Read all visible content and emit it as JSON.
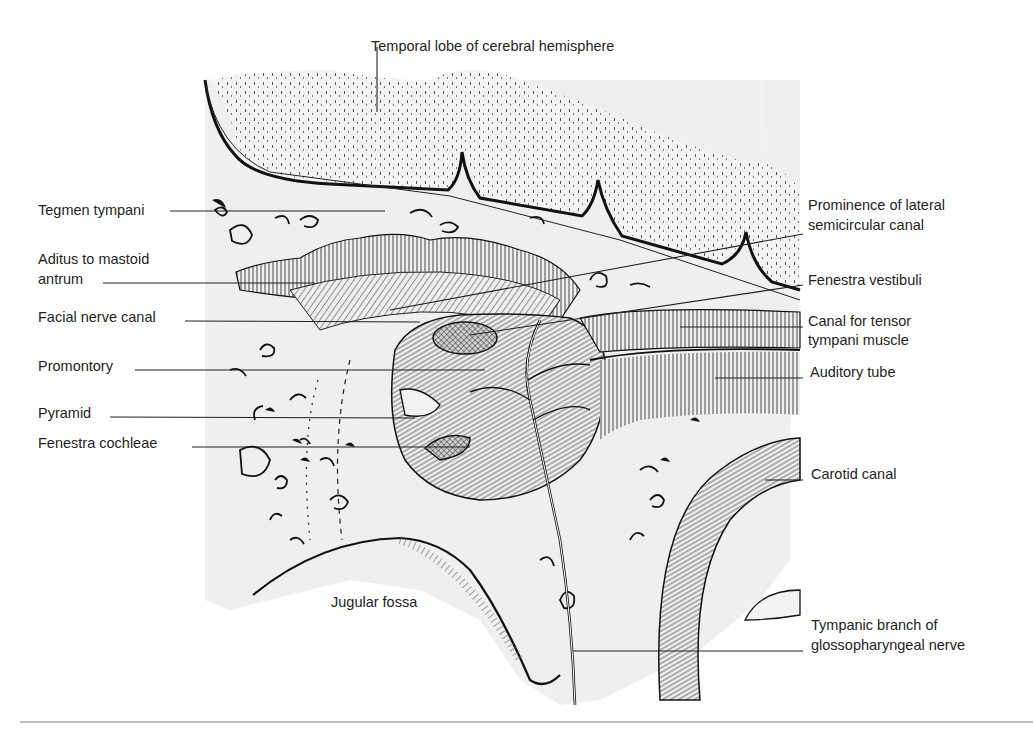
{
  "figure": {
    "colors": {
      "ink": "#231f20",
      "bone": "#efefef",
      "brain": "#e4e4e4",
      "leader": "#231f20",
      "rule": "#bdbdbd"
    }
  },
  "labels": {
    "temporal_lobe": "Temporal lobe of cerebral hemisphere",
    "tegmen_tympani": "Tegmen tympani",
    "aditus_line1": "Aditus to mastoid",
    "aditus_line2": "antrum",
    "facial_nerve_canal": "Facial nerve canal",
    "promontory": "Promontory",
    "pyramid": "Pyramid",
    "fenestra_cochleae": "Fenestra cochleae",
    "prominence_line1": "Prominence of lateral",
    "prominence_line2": "semicircular canal",
    "fenestra_vestibuli": "Fenestra vestibuli",
    "tensor_line1": "Canal for tensor",
    "tensor_line2": "tympani muscle",
    "auditory_tube": "Auditory tube",
    "carotid_canal": "Carotid canal",
    "jugular_fossa": "Jugular fossa",
    "tympanic_line1": "Tympanic branch of",
    "tympanic_line2": "glossopharyngeal nerve"
  }
}
